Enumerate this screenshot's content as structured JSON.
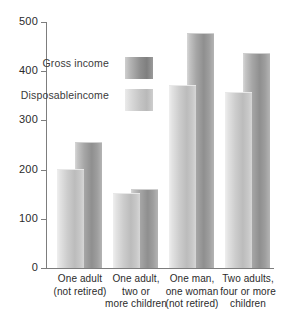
{
  "chart_data": {
    "type": "bar",
    "title": "",
    "subtitle": "",
    "xlabel": "",
    "ylabel": "",
    "ylim": [
      0,
      500
    ],
    "yticks": [
      0,
      100,
      200,
      300,
      400,
      500
    ],
    "ytick_labels": [
      "0",
      "100",
      "200",
      "300",
      "400",
      "500"
    ],
    "grid": false,
    "legend_position": "upper-left-inside",
    "categories": [
      "One adult (not retired)",
      "One adult, two or more children",
      "One man, one woman (not retired)",
      "Two adults, four or more children"
    ],
    "category_lines": [
      [
        "One adult",
        "(not retired)"
      ],
      [
        "One adult,",
        "two or",
        "more children"
      ],
      [
        "One man,",
        "one woman",
        "(not retired)"
      ],
      [
        "Two adults,",
        "four or more",
        "children"
      ]
    ],
    "series": [
      {
        "name": "Gross income",
        "color": "#8f8f8f",
        "values": [
          255,
          158,
          475,
          435
        ]
      },
      {
        "name": "Disposable income",
        "color": "#c6c6c6",
        "values": [
          200,
          150,
          370,
          355
        ]
      }
    ]
  },
  "legend": {
    "items": [
      {
        "label": "Gross income",
        "swatch": "gross-swatch"
      },
      {
        "label": "Disposable income",
        "swatch": "disposable-swatch"
      }
    ]
  },
  "axis": {
    "y_labels": [
      "500",
      "400",
      "300",
      "200",
      "100",
      "0"
    ]
  }
}
